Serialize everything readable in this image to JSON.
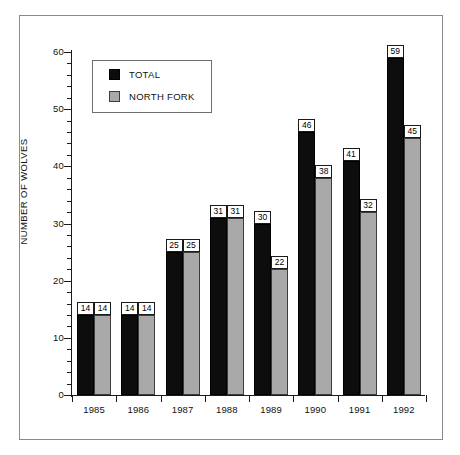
{
  "chart_data": {
    "type": "bar",
    "title": "",
    "xlabel": "",
    "ylabel": "NUMBER OF WOLVES",
    "categories": [
      "1985",
      "1986",
      "1987",
      "1988",
      "1989",
      "1990",
      "1991",
      "1992"
    ],
    "series": [
      {
        "name": "TOTAL",
        "color": "#0d0d0d",
        "values": [
          14,
          14,
          25,
          31,
          30,
          46,
          41,
          59
        ]
      },
      {
        "name": "NORTH FORK",
        "color": "#a9a9a9",
        "values": [
          14,
          14,
          25,
          31,
          22,
          38,
          32,
          45
        ]
      }
    ],
    "ylim": [
      0,
      60
    ],
    "y_ticks": [
      0,
      10,
      20,
      30,
      40,
      50,
      60
    ],
    "y_tick_labels": [
      "0",
      "10",
      "20",
      "30",
      "40",
      "50",
      "60"
    ],
    "y_minor_tick_step": 2,
    "grid": false,
    "legend_position": "top-left",
    "data_labels": true
  },
  "legend": {
    "entries": [
      {
        "label": "TOTAL",
        "swatch": "black-square"
      },
      {
        "label": "NORTH FORK",
        "swatch": "gray-square"
      }
    ]
  },
  "colors": {
    "total": "#0d0d0d",
    "north_fork": "#a9a9a9",
    "axis": "#1a1a1a",
    "frame": "#8a8a8a",
    "background": "#ffffff"
  }
}
